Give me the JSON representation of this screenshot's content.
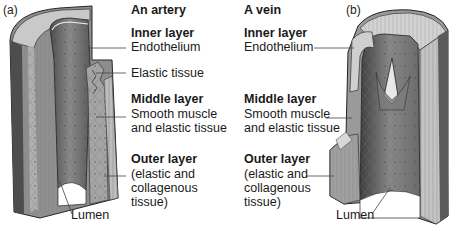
{
  "artery": {
    "panel_tag": "(a)",
    "title": "An artery",
    "inner_layer": {
      "heading": "Inner layer",
      "label": "Endothelium"
    },
    "elastic_label": "Elastic tissue",
    "middle_layer": {
      "heading": "Middle layer",
      "line1": "Smooth muscle",
      "line2": "and elastic tissue"
    },
    "outer_layer": {
      "heading": "Outer layer",
      "line1": "(elastic and",
      "line2": "collagenous",
      "line3": "tissue)"
    },
    "lumen_label": "Lumen"
  },
  "vein": {
    "panel_tag": "(b)",
    "title": "A vein",
    "inner_layer": {
      "heading": "Inner layer",
      "label": "Endothelium"
    },
    "middle_layer": {
      "heading": "Middle layer",
      "line1": "Smooth muscle",
      "line2": "and elastic tissue"
    },
    "outer_layer": {
      "heading": "Outer layer",
      "line1": "(elastic and",
      "line2": "collagenous",
      "line3": "tissue)"
    },
    "lumen_label": "Lumen"
  },
  "colors": {
    "dark_wall": "#5a5a5a",
    "mid_wall": "#8c8c8c",
    "light_wall": "#c8c8c8",
    "lumen_inner": "#7a7a7a",
    "leader_line": "#444444"
  }
}
